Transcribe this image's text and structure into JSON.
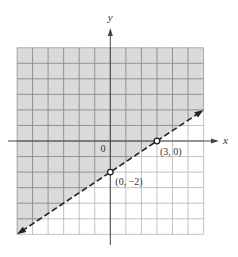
{
  "chart_data": {
    "type": "inequality-graph",
    "title": "",
    "xlabel": "x",
    "ylabel": "y",
    "xlim": [
      -6,
      6
    ],
    "ylim": [
      -6,
      6
    ],
    "grid": true,
    "grid_step": 1,
    "origin_label": "0",
    "boundary_line": {
      "equation": "y = (2/3)x - 2",
      "slope": 0.6667,
      "intercept": -2,
      "style": "dashed",
      "endpoints": [
        [
          -6,
          -6
        ],
        [
          6,
          2
        ]
      ],
      "arrows": "both"
    },
    "shaded_region": "above",
    "inequality": "2x - 3y < 6",
    "points": [
      {
        "x": 3,
        "y": 0,
        "label": "(3, 0)",
        "marker": "open-circle"
      },
      {
        "x": 0,
        "y": -2,
        "label": "(0, −2)",
        "marker": "open-circle"
      }
    ]
  },
  "colors": {
    "shade": "#dadada",
    "grid_shaded": "#8a8a8a",
    "grid_unshaded": "#b4b4b4",
    "axis": "#444444",
    "line": "#222222"
  },
  "labels": {
    "x_axis": "x",
    "y_axis": "y",
    "origin": "0",
    "point_a": "(3, 0)",
    "point_b": "(0, −2)"
  }
}
